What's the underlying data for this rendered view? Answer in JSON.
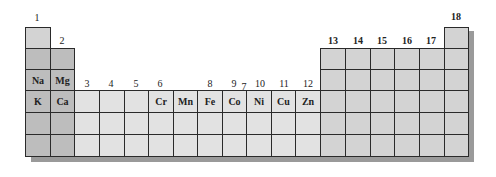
{
  "diagram": {
    "group_labels": {
      "g1": "1",
      "g2": "2",
      "g3": "3",
      "g4": "4",
      "g5": "5",
      "g6": "6",
      "g7": "7",
      "g8": "8",
      "g9": "9",
      "g10": "10",
      "g11": "11",
      "g12": "12",
      "g13": "13",
      "g14": "14",
      "g15": "15",
      "g16": "16",
      "g17": "17",
      "g18": "18"
    },
    "elements": {
      "na": "Na",
      "mg": "Mg",
      "k": "K",
      "ca": "Ca",
      "cr": "Cr",
      "mn": "Mn",
      "fe": "Fe",
      "co": "Co",
      "ni": "Ni",
      "cu": "Cu",
      "zn": "Zn"
    },
    "colors": {
      "s_block": "#bdbdbd",
      "d_block": "#e2e2e2",
      "p_block": "#d3d3d3",
      "shadow": "#9a9a9a",
      "border": "#2a2a2a"
    }
  }
}
